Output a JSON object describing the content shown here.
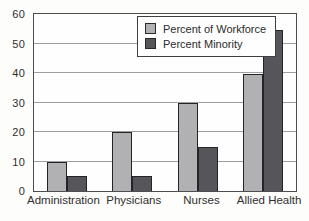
{
  "chart_data": {
    "type": "bar",
    "categories": [
      "Administration",
      "Physicians",
      "Nurses",
      "Allied Health"
    ],
    "series": [
      {
        "name": "Percent of Workforce",
        "color": "#b1b1b4",
        "values": [
          10,
          20,
          30,
          39.5
        ]
      },
      {
        "name": "Percent Minority",
        "color": "#55555a",
        "values": [
          5,
          5,
          15,
          54.5
        ]
      }
    ],
    "title": "",
    "xlabel": "",
    "ylabel": "",
    "ylim": [
      0,
      60
    ],
    "yticks": [
      0,
      10,
      20,
      30,
      40,
      50,
      60
    ],
    "grid": "horizontal",
    "legend_position": "inside-top-center",
    "colors": {
      "gridline": "#9f9f9f",
      "plot_border": "#4e4e4e",
      "bar_outline": "#242424",
      "background": "#fdfdfc"
    }
  }
}
